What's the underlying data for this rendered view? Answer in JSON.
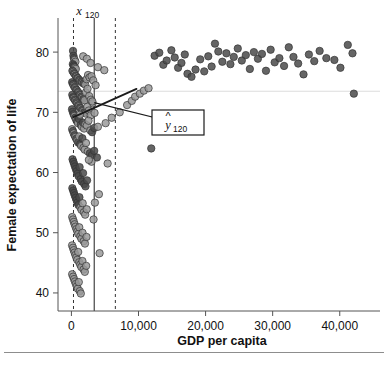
{
  "figure": {
    "background": "#ffffff",
    "separator_color": "#8d8d8d"
  },
  "chart_data": {
    "type": "scatter",
    "title": "",
    "xlabel": "GDP per capita",
    "ylabel": "Female expectation of life",
    "xlim": [
      -2000,
      46000
    ],
    "ylim": [
      37,
      85
    ],
    "xticks": [
      0,
      10000,
      20000,
      30000,
      40000
    ],
    "xtick_labels": [
      "0",
      "10,000",
      "20,000",
      "30,000",
      "40,000"
    ],
    "yticks": [
      40,
      50,
      60,
      70,
      80
    ],
    "ytick_labels": [
      "40",
      "50",
      "60",
      "70",
      "80"
    ],
    "grid": false,
    "legend": null,
    "marker": {
      "shape": "circle",
      "size": 6,
      "fill_light": "#9a9a9a",
      "fill_dark": "#4a4a4a",
      "edge": "#333333",
      "opacity": 0.85
    },
    "annotations": [
      {
        "name": "x-predictor-label",
        "text": "x",
        "subscript": "120",
        "x": 3400,
        "y": 85,
        "style": "italic-math"
      },
      {
        "name": "y-hat-box-label",
        "text": "y",
        "hat": true,
        "subscript": "120",
        "x": 15500,
        "y": 68.5,
        "style": "boxed-italic-math"
      }
    ],
    "reference_lines": [
      {
        "name": "lower-dashed-vline",
        "orientation": "vertical",
        "x": 310,
        "style": "dashed",
        "color": "#333333"
      },
      {
        "name": "predictor-solid-vline",
        "orientation": "vertical",
        "x": 3400,
        "style": "solid",
        "color": "#333333"
      },
      {
        "name": "upper-dashed-vline",
        "orientation": "vertical",
        "x": 6550,
        "style": "dashed",
        "color": "#333333"
      },
      {
        "name": "mean-horizontal-line",
        "orientation": "horizontal",
        "y": 73.5,
        "style": "solid-faint",
        "color": "#dcdcdc"
      }
    ],
    "fit_line": {
      "name": "regression-line",
      "x_start": 310,
      "y_start": 69.2,
      "x_end": 9700,
      "y_end": 73.9,
      "color": "#1a1a1a",
      "width": 1.8
    },
    "arrow": {
      "name": "prediction-arrow",
      "x_start": 3400,
      "y_start": 71.6,
      "x_end": 14300,
      "y_end": 68.6,
      "color": "#1a1a1a"
    },
    "points": [
      [
        240,
        80.2
      ],
      [
        300,
        79.4
      ],
      [
        360,
        79.0
      ],
      [
        480,
        78.7
      ],
      [
        600,
        78.4
      ],
      [
        210,
        78.0
      ],
      [
        330,
        77.8
      ],
      [
        420,
        77.6
      ],
      [
        540,
        77.4
      ],
      [
        660,
        77.2
      ],
      [
        1750,
        79.3
      ],
      [
        2300,
        78.9
      ],
      [
        2850,
        78.2
      ],
      [
        3950,
        77.5
      ],
      [
        4900,
        77.0
      ],
      [
        150,
        76.9
      ],
      [
        280,
        76.7
      ],
      [
        390,
        76.5
      ],
      [
        510,
        76.3
      ],
      [
        640,
        76.1
      ],
      [
        760,
        75.9
      ],
      [
        880,
        75.7
      ],
      [
        990,
        75.6
      ],
      [
        1150,
        75.4
      ],
      [
        1310,
        75.2
      ],
      [
        1480,
        75.1
      ],
      [
        1650,
        74.9
      ],
      [
        1820,
        74.8
      ],
      [
        2050,
        74.6
      ],
      [
        2260,
        75.5
      ],
      [
        2480,
        76.2
      ],
      [
        2700,
        75.8
      ],
      [
        3000,
        76.0
      ],
      [
        3250,
        75.3
      ],
      [
        3600,
        74.5
      ],
      [
        110,
        75.0
      ],
      [
        230,
        74.7
      ],
      [
        350,
        74.4
      ],
      [
        470,
        74.2
      ],
      [
        590,
        74.0
      ],
      [
        710,
        73.8
      ],
      [
        830,
        73.6
      ],
      [
        960,
        73.4
      ],
      [
        1080,
        73.2
      ],
      [
        1200,
        73.0
      ],
      [
        1340,
        72.8
      ],
      [
        1470,
        72.6
      ],
      [
        1620,
        72.4
      ],
      [
        1780,
        72.2
      ],
      [
        1950,
        72.0
      ],
      [
        2150,
        73.3
      ],
      [
        2400,
        73.9
      ],
      [
        2650,
        72.7
      ],
      [
        2900,
        72.1
      ],
      [
        3150,
        71.5
      ],
      [
        130,
        72.9
      ],
      [
        250,
        72.5
      ],
      [
        370,
        72.3
      ],
      [
        490,
        72.1
      ],
      [
        610,
        71.9
      ],
      [
        740,
        71.7
      ],
      [
        870,
        71.4
      ],
      [
        1000,
        71.2
      ],
      [
        1130,
        71.0
      ],
      [
        1280,
        70.8
      ],
      [
        1430,
        70.6
      ],
      [
        1580,
        70.4
      ],
      [
        1750,
        70.2
      ],
      [
        1930,
        70.0
      ],
      [
        2120,
        69.8
      ],
      [
        2350,
        70.9
      ],
      [
        2600,
        70.3
      ],
      [
        2880,
        69.5
      ],
      [
        3120,
        71.8
      ],
      [
        3450,
        69.9
      ],
      [
        90,
        70.5
      ],
      [
        200,
        70.1
      ],
      [
        320,
        69.7
      ],
      [
        450,
        69.4
      ],
      [
        580,
        69.1
      ],
      [
        700,
        68.8
      ],
      [
        840,
        68.5
      ],
      [
        980,
        68.2
      ],
      [
        1120,
        68.9
      ],
      [
        1260,
        69.6
      ],
      [
        1400,
        67.9
      ],
      [
        1560,
        67.6
      ],
      [
        1720,
        68.3
      ],
      [
        1890,
        67.3
      ],
      [
        2070,
        68.0
      ],
      [
        2300,
        67.8
      ],
      [
        2550,
        68.6
      ],
      [
        2820,
        67.0
      ],
      [
        3080,
        66.7
      ],
      [
        3400,
        67.4
      ],
      [
        100,
        67.2
      ],
      [
        220,
        66.9
      ],
      [
        340,
        66.5
      ],
      [
        460,
        66.2
      ],
      [
        590,
        65.9
      ],
      [
        720,
        65.6
      ],
      [
        860,
        65.3
      ],
      [
        1000,
        65.0
      ],
      [
        1150,
        66.0
      ],
      [
        1300,
        64.7
      ],
      [
        1460,
        64.4
      ],
      [
        1630,
        65.7
      ],
      [
        1800,
        64.1
      ],
      [
        1980,
        63.8
      ],
      [
        2170,
        64.9
      ],
      [
        2450,
        63.5
      ],
      [
        2750,
        63.2
      ],
      [
        3050,
        62.9
      ],
      [
        3400,
        63.6
      ],
      [
        3800,
        62.5
      ],
      [
        3950,
        67.6
      ],
      [
        5100,
        68.2
      ],
      [
        6000,
        69.1
      ],
      [
        7200,
        70.0
      ],
      [
        8300,
        71.2
      ],
      [
        9000,
        71.9
      ],
      [
        9500,
        72.6
      ],
      [
        10200,
        73.1
      ],
      [
        10800,
        73.6
      ],
      [
        11500,
        74.0
      ],
      [
        11900,
        64.0
      ],
      [
        12400,
        79.4
      ],
      [
        13100,
        79.9
      ],
      [
        13700,
        77.9
      ],
      [
        14200,
        78.6
      ],
      [
        14900,
        80.3
      ],
      [
        15400,
        79.1
      ],
      [
        15900,
        77.4
      ],
      [
        16400,
        78.2
      ],
      [
        16900,
        79.6
      ],
      [
        17300,
        76.4
      ],
      [
        17900,
        75.9
      ],
      [
        18500,
        77.1
      ],
      [
        19200,
        78.8
      ],
      [
        19800,
        76.8
      ],
      [
        20400,
        79.3
      ],
      [
        20900,
        77.6
      ],
      [
        21400,
        81.4
      ],
      [
        21900,
        80.1
      ],
      [
        22500,
        78.4
      ],
      [
        23100,
        79.8
      ],
      [
        23700,
        78.0
      ],
      [
        24200,
        79.2
      ],
      [
        24800,
        80.6
      ],
      [
        25400,
        78.6
      ],
      [
        26000,
        79.5
      ],
      [
        26600,
        77.2
      ],
      [
        27200,
        80.0
      ],
      [
        27800,
        78.9
      ],
      [
        28400,
        79.7
      ],
      [
        29000,
        76.9
      ],
      [
        29700,
        80.4
      ],
      [
        30300,
        78.3
      ],
      [
        31000,
        79.0
      ],
      [
        31700,
        77.7
      ],
      [
        32400,
        80.8
      ],
      [
        33100,
        79.2
      ],
      [
        33800,
        78.1
      ],
      [
        34600,
        76.3
      ],
      [
        35400,
        79.6
      ],
      [
        36200,
        78.5
      ],
      [
        37000,
        80.2
      ],
      [
        38000,
        79.0
      ],
      [
        39200,
        78.7
      ],
      [
        40100,
        77.4
      ],
      [
        41200,
        81.2
      ],
      [
        41900,
        79.8
      ],
      [
        42100,
        73.1
      ],
      [
        170,
        62.2
      ],
      [
        290,
        61.8
      ],
      [
        410,
        61.4
      ],
      [
        530,
        61.0
      ],
      [
        660,
        60.6
      ],
      [
        790,
        60.2
      ],
      [
        930,
        59.8
      ],
      [
        1070,
        59.4
      ],
      [
        1220,
        60.9
      ],
      [
        1380,
        58.9
      ],
      [
        1550,
        58.5
      ],
      [
        1740,
        59.9
      ],
      [
        1900,
        58.1
      ],
      [
        2100,
        57.7
      ],
      [
        2330,
        58.7
      ],
      [
        140,
        57.4
      ],
      [
        260,
        57.0
      ],
      [
        380,
        56.6
      ],
      [
        500,
        56.2
      ],
      [
        630,
        55.8
      ],
      [
        770,
        55.4
      ],
      [
        900,
        55.0
      ],
      [
        1050,
        54.6
      ],
      [
        1190,
        55.9
      ],
      [
        1340,
        54.2
      ],
      [
        1500,
        53.8
      ],
      [
        1680,
        54.9
      ],
      [
        1850,
        53.4
      ],
      [
        2050,
        53.0
      ],
      [
        2280,
        53.9
      ],
      [
        120,
        52.6
      ],
      [
        240,
        52.2
      ],
      [
        360,
        51.8
      ],
      [
        480,
        51.4
      ],
      [
        610,
        51.0
      ],
      [
        750,
        50.6
      ],
      [
        880,
        50.2
      ],
      [
        1020,
        49.8
      ],
      [
        1170,
        50.9
      ],
      [
        1320,
        49.4
      ],
      [
        1480,
        49.0
      ],
      [
        1650,
        50.0
      ],
      [
        1830,
        48.6
      ],
      [
        2020,
        48.2
      ],
      [
        2250,
        49.3
      ],
      [
        100,
        47.9
      ],
      [
        230,
        47.5
      ],
      [
        350,
        47.1
      ],
      [
        470,
        46.7
      ],
      [
        600,
        46.3
      ],
      [
        730,
        45.9
      ],
      [
        870,
        45.5
      ],
      [
        1010,
        46.8
      ],
      [
        1160,
        45.1
      ],
      [
        1310,
        44.7
      ],
      [
        1470,
        44.3
      ],
      [
        1640,
        45.3
      ],
      [
        1820,
        43.9
      ],
      [
        2000,
        43.5
      ],
      [
        2200,
        44.5
      ],
      [
        110,
        43.1
      ],
      [
        250,
        42.7
      ],
      [
        390,
        42.3
      ],
      [
        520,
        41.9
      ],
      [
        660,
        41.5
      ],
      [
        800,
        41.1
      ],
      [
        950,
        40.7
      ],
      [
        1100,
        41.8
      ],
      [
        1250,
        40.3
      ],
      [
        1400,
        39.9
      ],
      [
        3000,
        61.8
      ],
      [
        5400,
        61.5
      ],
      [
        3500,
        55.0
      ],
      [
        3300,
        52.2
      ],
      [
        4200,
        46.6
      ],
      [
        2600,
        62.1
      ],
      [
        4100,
        56.4
      ]
    ],
    "light_point_indices": [
      3,
      4,
      8,
      9,
      10,
      11,
      12,
      13,
      14,
      16,
      18,
      20,
      22,
      24,
      26,
      28,
      29,
      30,
      31,
      32,
      33,
      34,
      37,
      39,
      41,
      43,
      45,
      47,
      49,
      50,
      51,
      52,
      53,
      54,
      57,
      59,
      61,
      63,
      65,
      67,
      69,
      70,
      71,
      72,
      73,
      74,
      78,
      80,
      82,
      84,
      86,
      88,
      89,
      90,
      91,
      92,
      95,
      97,
      99,
      101,
      103,
      105,
      107,
      108,
      109,
      110,
      115,
      116,
      117,
      118,
      119,
      120,
      121,
      122,
      123,
      124,
      197,
      198,
      199,
      200,
      201,
      202,
      203,
      204,
      205,
      206,
      207,
      208,
      209,
      210,
      211,
      212,
      213,
      214,
      215,
      216,
      217,
      218,
      219,
      220,
      221,
      222,
      223,
      224,
      225,
      226,
      227,
      228,
      229,
      230,
      231,
      232,
      233,
      234,
      235,
      236,
      237,
      238,
      239,
      240,
      241,
      242,
      243,
      244,
      245,
      246,
      247,
      248,
      249,
      250,
      251,
      252,
      253,
      254,
      255,
      256
    ]
  }
}
